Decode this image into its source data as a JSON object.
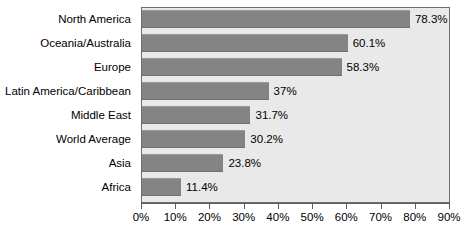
{
  "chart_data": {
    "type": "bar",
    "orientation": "horizontal",
    "title": "",
    "xlabel": "",
    "ylabel": "",
    "categories": [
      "North America",
      "Oceania/Australia",
      "Europe",
      "Latin America/Caribbean",
      "Middle East",
      "World Average",
      "Asia",
      "Africa"
    ],
    "values": [
      78.3,
      60.1,
      58.3,
      37,
      31.7,
      30.2,
      23.8,
      11.4
    ],
    "value_labels": [
      "78.3%",
      "60.1%",
      "58.3%",
      "37%",
      "31.7%",
      "30.2%",
      "23.8%",
      "11.4%"
    ],
    "xlim": [
      0,
      90
    ],
    "xticks": [
      0,
      10,
      20,
      30,
      40,
      50,
      60,
      70,
      80,
      90
    ],
    "xtick_labels": [
      "0%",
      "10%",
      "20%",
      "30%",
      "40%",
      "50%",
      "60%",
      "70%",
      "80%",
      "90%"
    ],
    "grid": false,
    "legend": null,
    "colors": {
      "bar_fill": "#848484",
      "plot_background": "#e9e9e9",
      "frame": "#6e6e6e",
      "text": "#000000",
      "canvas": "#ffffff"
    }
  }
}
